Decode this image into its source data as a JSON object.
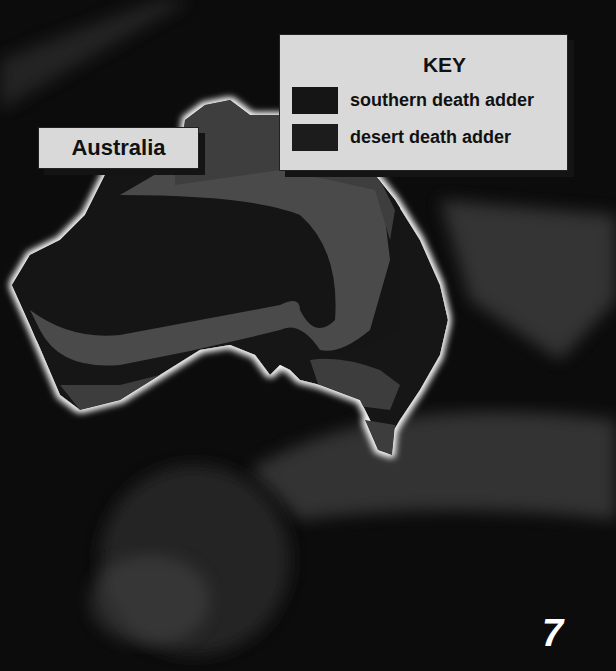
{
  "map": {
    "region_label": "Australia",
    "key": {
      "title": "KEY",
      "entries": [
        {
          "label": "southern death adder",
          "color": "#151515"
        },
        {
          "label": "desert death adder",
          "color": "#1c1c1c"
        }
      ]
    },
    "colors": {
      "southern_range": "#151515",
      "desert_range": "#4a4a4a",
      "land_other": "#3d3d3d",
      "coast_glow": "#ffffff"
    }
  },
  "page": {
    "number": "7"
  }
}
